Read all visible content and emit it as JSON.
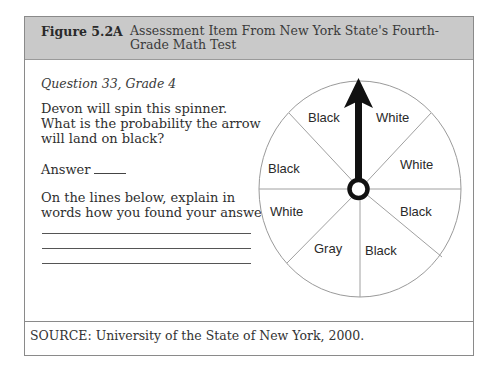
{
  "figure": {
    "number": "Figure 5.2A",
    "title": "Assessment Item From New York State's Fourth-Grade Math Test"
  },
  "question": {
    "label": "Question 33, Grade 4",
    "prompt": "Devon will spin this spinner. What is the probability the arrow will land on black?",
    "answer_label": "Answer",
    "explain_prompt": "On the lines below, explain in words how you found your answer.",
    "answer_lines": 3
  },
  "spinner": {
    "sector_count": 8,
    "arrow_direction": "up",
    "sectors": [
      {
        "position": "top-left",
        "label": "Black"
      },
      {
        "position": "top-right",
        "label": "White"
      },
      {
        "position": "right-upper",
        "label": "White"
      },
      {
        "position": "right-lower",
        "label": "Black"
      },
      {
        "position": "bottom-right",
        "label": "Black"
      },
      {
        "position": "bottom-left",
        "label": "Gray"
      },
      {
        "position": "left-lower",
        "label": "White"
      },
      {
        "position": "left-upper",
        "label": "Black"
      }
    ]
  },
  "source": {
    "text": "SOURCE: University of the State of New York, 2000."
  },
  "colors": {
    "header_bg": "#c9c9c9",
    "border": "#8a8a8a",
    "arrow": "#111111",
    "spinner_line": "#9a9a9a"
  }
}
